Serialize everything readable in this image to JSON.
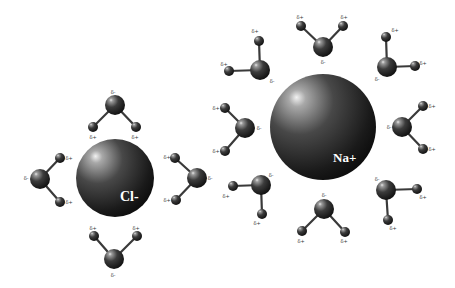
{
  "colors": {
    "background": "#ffffff",
    "sphere_dark": "#0e0e0e",
    "sphere_mid": "#3c3c3c",
    "sphere_highlight": "#e8e8e8",
    "bond": "#3a3a3a",
    "label_text": "#ffffff"
  },
  "ions": [
    {
      "id": "chloride",
      "label": "Cl-",
      "cx": 115,
      "cy": 178,
      "r": 39,
      "label_x": 120,
      "label_y": 201,
      "label_size": 14,
      "charge": "negative"
    },
    {
      "id": "sodium",
      "label": "Na+",
      "cx": 323,
      "cy": 127,
      "r": 53,
      "label_x": 333,
      "label_y": 162,
      "label_size": 13,
      "charge": "positive"
    }
  ],
  "water_molecules": [
    {
      "ion": "chloride",
      "position": "top",
      "O": [
        115,
        105
      ],
      "H1": [
        93,
        127
      ],
      "H2": [
        136,
        127
      ],
      "O_charge": "δ-",
      "O_label": [
        113,
        92
      ],
      "H_charge": "δ+",
      "H1_label": [
        93,
        137
      ],
      "H2_label": [
        135,
        137
      ]
    },
    {
      "ion": "chloride",
      "position": "left",
      "O": [
        40,
        179
      ],
      "H1": [
        60,
        158
      ],
      "H2": [
        60,
        202
      ],
      "O_charge": "δ-",
      "O_label": [
        26,
        178
      ],
      "H_charge": "δ+",
      "H1_label": [
        69,
        158
      ],
      "H2_label": [
        69,
        202
      ]
    },
    {
      "ion": "chloride",
      "position": "right",
      "O": [
        197,
        178
      ],
      "H1": [
        175,
        158
      ],
      "H2": [
        176,
        200
      ],
      "O_charge": "δ-",
      "O_label": [
        210,
        178
      ],
      "H_charge": "δ+",
      "H1_label": [
        167,
        157
      ],
      "H2_label": [
        167,
        200
      ]
    },
    {
      "ion": "chloride",
      "position": "bottom",
      "O": [
        114,
        259
      ],
      "H1": [
        94,
        236
      ],
      "H2": [
        137,
        236
      ],
      "O_charge": "δ-",
      "O_label": [
        113,
        275
      ],
      "H_charge": "δ+",
      "H1_label": [
        93,
        228
      ],
      "H2_label": [
        136,
        228
      ]
    },
    {
      "ion": "sodium",
      "position": "top",
      "O": [
        323,
        47
      ],
      "H1": [
        301,
        26
      ],
      "H2": [
        343,
        26
      ],
      "O_charge": "δ-",
      "O_label": [
        323,
        62
      ],
      "H_charge": "δ+",
      "H1_label": [
        300,
        17
      ],
      "H2_label": [
        344,
        17
      ]
    },
    {
      "ion": "sodium",
      "position": "upper-left",
      "O": [
        260,
        70
      ],
      "H1": [
        259,
        41
      ],
      "H2": [
        229,
        71
      ],
      "O_charge": "δ-",
      "O_label": [
        272,
        81
      ],
      "H_charge": "δ+",
      "H1_label": [
        255,
        31
      ],
      "H2_label": [
        224,
        64
      ]
    },
    {
      "ion": "sodium",
      "position": "upper-right",
      "O": [
        387,
        67
      ],
      "H1": [
        386,
        37
      ],
      "H2": [
        415,
        66
      ],
      "O_charge": "δ-",
      "O_label": [
        377,
        79
      ],
      "H_charge": "δ+",
      "H1_label": [
        395,
        30
      ],
      "H2_label": [
        423,
        63
      ]
    },
    {
      "ion": "sodium",
      "position": "left",
      "O": [
        245,
        128
      ],
      "H1": [
        225,
        108
      ],
      "H2": [
        225,
        151
      ],
      "O_charge": "δ-",
      "O_label": [
        259,
        128
      ],
      "H_charge": "δ+",
      "H1_label": [
        216,
        108
      ],
      "H2_label": [
        216,
        151
      ]
    },
    {
      "ion": "sodium",
      "position": "right",
      "O": [
        402,
        127
      ],
      "H1": [
        423,
        106
      ],
      "H2": [
        423,
        149
      ],
      "O_charge": "δ-",
      "O_label": [
        389,
        127
      ],
      "H_charge": "δ+",
      "H1_label": [
        432,
        106
      ],
      "H2_label": [
        432,
        149
      ]
    },
    {
      "ion": "sodium",
      "position": "lower-left",
      "O": [
        261,
        185
      ],
      "H1": [
        233,
        186
      ],
      "H2": [
        262,
        214
      ],
      "O_charge": "δ-",
      "O_label": [
        271,
        175
      ],
      "H_charge": "δ+",
      "H1_label": [
        226,
        196
      ],
      "H2_label": [
        257,
        223
      ]
    },
    {
      "ion": "sodium",
      "position": "lower-right",
      "O": [
        386,
        190
      ],
      "H1": [
        417,
        189
      ],
      "H2": [
        388,
        220
      ],
      "O_charge": "δ-",
      "O_label": [
        377,
        179
      ],
      "H_charge": "δ+",
      "H1_label": [
        423,
        197
      ],
      "H2_label": [
        393,
        228
      ]
    },
    {
      "ion": "sodium",
      "position": "bottom",
      "O": [
        324,
        209
      ],
      "H1": [
        302,
        231
      ],
      "H2": [
        345,
        232
      ],
      "O_charge": "δ-",
      "O_label": [
        324,
        195
      ],
      "H_charge": "δ+",
      "H1_label": [
        301,
        241
      ],
      "H2_label": [
        344,
        241
      ]
    }
  ],
  "atom_radii": {
    "oxygen": 10,
    "hydrogen": 5
  }
}
